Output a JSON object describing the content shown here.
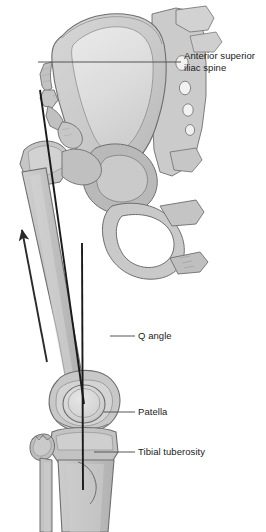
{
  "figure": {
    "background_color": "#ffffff",
    "width": 266,
    "height": 532
  },
  "labels": {
    "asis": {
      "line1": "Anterior superior",
      "line2": "iliac spine"
    },
    "q_angle": "Q angle",
    "patella": "Patella",
    "tibial_tuberosity": "Tibial tuberosity"
  },
  "colors": {
    "bone_fill_light": "#d8d8d8",
    "bone_fill_mid": "#c4c4c4",
    "bone_fill_dark": "#b0b0b0",
    "bone_fill_pale": "#e8e8e8",
    "bone_outline": "#6e6e6e",
    "leader_line": "#555555",
    "measure_line": "#1a1a1a",
    "arrow": "#2a2a2a",
    "text": "#1a1a1a"
  },
  "structures": {
    "pelvis": "pelvis-ilium-sacrum",
    "femur": "femur",
    "patella": "patella",
    "tibia": "tibia",
    "fibula": "fibula"
  },
  "annotations": {
    "quadriceps_vector_arrow": "upward-force-arrow",
    "q_angle_line_femoral": "asis-to-patella-line",
    "q_angle_line_patellar": "patella-to-tibial-tuberosity-line"
  }
}
